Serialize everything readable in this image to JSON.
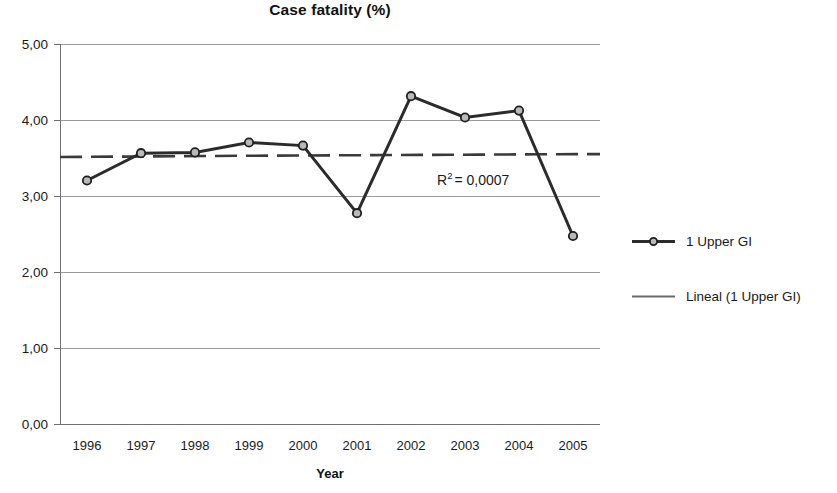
{
  "chart_data": {
    "type": "line",
    "title": "Case fatality (%)",
    "xlabel": "Year",
    "ylabel": "",
    "categories": [
      "1996",
      "1997",
      "1998",
      "1999",
      "2000",
      "2001",
      "2002",
      "2003",
      "2004",
      "2005"
    ],
    "series": [
      {
        "name": "1 Upper GI",
        "values": [
          3.21,
          3.57,
          3.58,
          3.71,
          3.67,
          2.78,
          4.32,
          4.04,
          4.13,
          2.48
        ]
      },
      {
        "name": "Lineal (1 Upper GI)",
        "type": "trendline",
        "values": [
          3.52,
          3.525,
          3.53,
          3.535,
          3.54,
          3.543,
          3.547,
          3.551,
          3.555,
          3.558
        ]
      }
    ],
    "ylim": [
      0,
      5
    ],
    "ytick_values": [
      0,
      1,
      2,
      3,
      4,
      5
    ],
    "ytick_labels": [
      "0,00",
      "1,00",
      "2,00",
      "3,00",
      "4,00",
      "5,00"
    ],
    "grid": "horizontal",
    "legend_position": "right",
    "annotations": [
      {
        "name": "r-squared",
        "prefix": "R",
        "superscript": "2",
        "suffix": "= 0,0007",
        "full_text": "R2 = 0,0007",
        "x_value": 2002,
        "y_value": 3.27
      }
    ],
    "colors": {
      "series_line": "#2b2b2b",
      "trendline": "#3a3a3a",
      "marker_fill": "#b9b9b9",
      "marker_stroke": "#1f1f1f",
      "gridline": "#9a9a9a",
      "axis": "#6f6f6f",
      "text": "#1a1a1a",
      "background": "#ffffff"
    }
  },
  "legend": {
    "items": [
      {
        "label": "1 Upper GI",
        "marker": "line-with-circle-marker"
      },
      {
        "label": "Lineal (1 Upper GI)",
        "marker": "plain-line"
      }
    ]
  }
}
